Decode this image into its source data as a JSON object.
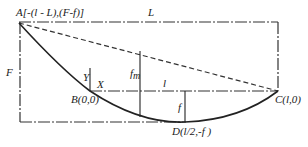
{
  "diagram": {
    "type": "catenary-cable-geometry",
    "points": {
      "A": {
        "label": "A[-(l - L),(F-f)]"
      },
      "B": {
        "label": "B(0,0)"
      },
      "C": {
        "label": "C(l,0)"
      },
      "D": {
        "label": "D(l/2,-f )"
      }
    },
    "dimensions": {
      "L": "L",
      "F": "F",
      "l": "l",
      "f": "f",
      "f_m_main": "f",
      "f_m_sub": "m"
    },
    "axes": {
      "x": "X",
      "y": "Y"
    }
  }
}
